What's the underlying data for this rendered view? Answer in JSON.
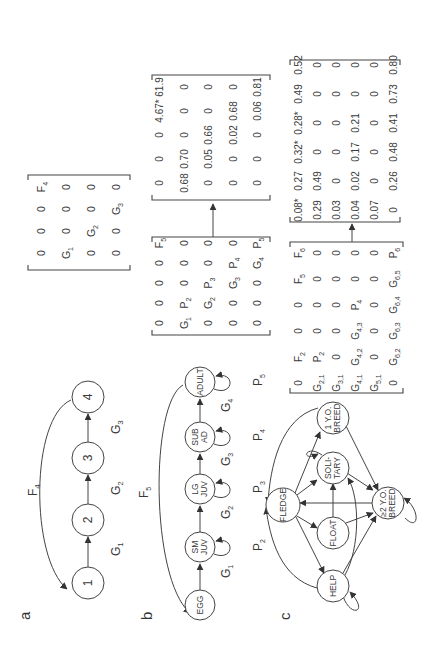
{
  "figure": {
    "orientation": "rotated 90 degrees counter-clockwise",
    "panels": [
      {
        "label": "a",
        "nodes": [
          "1",
          "2",
          "3",
          "4"
        ],
        "transitions": [
          {
            "from": "1",
            "to": "2",
            "label": "G",
            "sub": "1"
          },
          {
            "from": "2",
            "to": "3",
            "label": "G",
            "sub": "2"
          },
          {
            "from": "3",
            "to": "4",
            "label": "G",
            "sub": "3"
          },
          {
            "from": "4",
            "to": "1",
            "label": "F",
            "sub": "4"
          }
        ],
        "matrix": [
          [
            {
              "t": "0"
            },
            {
              "t": "0"
            },
            {
              "t": "0"
            },
            {
              "t": "F",
              "s": "4"
            }
          ],
          [
            {
              "t": "G",
              "s": "1"
            },
            {
              "t": "0"
            },
            {
              "t": "0"
            },
            {
              "t": "0"
            }
          ],
          [
            {
              "t": "0"
            },
            {
              "t": "G",
              "s": "2"
            },
            {
              "t": "0"
            },
            {
              "t": "0"
            }
          ],
          [
            {
              "t": "0"
            },
            {
              "t": "0"
            },
            {
              "t": "G",
              "s": "3"
            },
            {
              "t": "0"
            }
          ]
        ]
      },
      {
        "label": "b",
        "nodes": [
          {
            "id": "egg",
            "lines": [
              "EGG"
            ]
          },
          {
            "id": "smjuv",
            "lines": [
              "SM",
              "JUV"
            ]
          },
          {
            "id": "lgjuv",
            "lines": [
              "LG",
              "JUV"
            ]
          },
          {
            "id": "subad",
            "lines": [
              "SUB",
              "AD"
            ]
          },
          {
            "id": "adult",
            "lines": [
              "ADULT"
            ]
          }
        ],
        "growth_labels": [
          {
            "t": "G",
            "s": "1"
          },
          {
            "t": "G",
            "s": "2"
          },
          {
            "t": "G",
            "s": "3"
          },
          {
            "t": "G",
            "s": "4"
          }
        ],
        "persist_labels": [
          {
            "t": "P",
            "s": "2"
          },
          {
            "t": "P",
            "s": "3"
          },
          {
            "t": "P",
            "s": "4"
          },
          {
            "t": "P",
            "s": "5"
          }
        ],
        "fecundity_label": {
          "t": "F",
          "s": "5"
        },
        "symbolic_matrix": [
          [
            {
              "t": "0"
            },
            {
              "t": "0"
            },
            {
              "t": "0"
            },
            {
              "t": "0"
            },
            {
              "t": "F",
              "s": "5"
            }
          ],
          [
            {
              "t": "G",
              "s": "1"
            },
            {
              "t": "P",
              "s": "2"
            },
            {
              "t": "0"
            },
            {
              "t": "0"
            },
            {
              "t": "0"
            }
          ],
          [
            {
              "t": "0"
            },
            {
              "t": "G",
              "s": "2"
            },
            {
              "t": "P",
              "s": "3"
            },
            {
              "t": "0"
            },
            {
              "t": "0"
            }
          ],
          [
            {
              "t": "0"
            },
            {
              "t": "0"
            },
            {
              "t": "G",
              "s": "3"
            },
            {
              "t": "P",
              "s": "4"
            },
            {
              "t": "0"
            }
          ],
          [
            {
              "t": "0"
            },
            {
              "t": "0"
            },
            {
              "t": "0"
            },
            {
              "t": "G",
              "s": "4"
            },
            {
              "t": "P",
              "s": "5"
            }
          ]
        ],
        "numeric_matrix": [
          [
            "0",
            "0",
            "0",
            "4.67*",
            "61.9"
          ],
          [
            "0.68",
            "0.70",
            "0",
            "0",
            "0"
          ],
          [
            "0",
            "0.05",
            "0.66",
            "0",
            "0"
          ],
          [
            "0",
            "0",
            "0.02",
            "0.68",
            "0"
          ],
          [
            "0",
            "0",
            "0",
            "0.06",
            "0.81"
          ]
        ]
      },
      {
        "label": "c",
        "nodes": [
          {
            "id": "fledge",
            "lines": [
              "FLEDGE"
            ]
          },
          {
            "id": "help",
            "lines": [
              "HELP"
            ]
          },
          {
            "id": "float",
            "lines": [
              "FLOAT"
            ]
          },
          {
            "id": "solitary",
            "lines": [
              "SOLI-",
              "TARY"
            ]
          },
          {
            "id": "oneyo",
            "lines": [
              "1 Y.O.",
              "BREED"
            ]
          },
          {
            "id": "twoyo",
            "lines": [
              "≥2 Y.O.",
              "BREED"
            ]
          }
        ],
        "symbolic_matrix": [
          [
            {
              "t": "0"
            },
            {
              "t": "F",
              "s": "2"
            },
            {
              "t": "0"
            },
            {
              "t": "0"
            },
            {
              "t": "F",
              "s": "5"
            },
            {
              "t": "F",
              "s": "6"
            }
          ],
          [
            {
              "t": "G",
              "s": "2,1"
            },
            {
              "t": "P",
              "s": "2"
            },
            {
              "t": "0"
            },
            {
              "t": "0"
            },
            {
              "t": "0"
            },
            {
              "t": "0"
            }
          ],
          [
            {
              "t": "G",
              "s": "3,1"
            },
            {
              "t": "0"
            },
            {
              "t": "0"
            },
            {
              "t": "0"
            },
            {
              "t": "0"
            },
            {
              "t": "0"
            }
          ],
          [
            {
              "t": "G",
              "s": "4,1"
            },
            {
              "t": "G",
              "s": "4,2"
            },
            {
              "t": "G",
              "s": "4,3"
            },
            {
              "t": "P",
              "s": "4"
            },
            {
              "t": "0"
            },
            {
              "t": "0"
            }
          ],
          [
            {
              "t": "G",
              "s": "5,1"
            },
            {
              "t": "0"
            },
            {
              "t": "0"
            },
            {
              "t": "0"
            },
            {
              "t": "0"
            },
            {
              "t": "0"
            }
          ],
          [
            {
              "t": "0"
            },
            {
              "t": "G",
              "s": "6,2"
            },
            {
              "t": "G",
              "s": "6,3"
            },
            {
              "t": "G",
              "s": "6,4"
            },
            {
              "t": "G",
              "s": "6,5"
            },
            {
              "t": "P",
              "s": "6"
            }
          ]
        ],
        "numeric_matrix": [
          [
            "0.08*",
            "0.27",
            "0.32*",
            "0.28*",
            "0.49",
            "0.52"
          ],
          [
            "0.29",
            "0.49",
            "0",
            "0",
            "0",
            "0"
          ],
          [
            "0.03",
            "0",
            "0",
            "0",
            "0",
            "0"
          ],
          [
            "0.04",
            "0.02",
            "0.17",
            "0.21",
            "0",
            "0"
          ],
          [
            "0.07",
            "0",
            "0",
            "0",
            "0",
            "0"
          ],
          [
            "0",
            "0.26",
            "0.48",
            "0.41",
            "0.73",
            "0.80"
          ]
        ]
      }
    ]
  }
}
